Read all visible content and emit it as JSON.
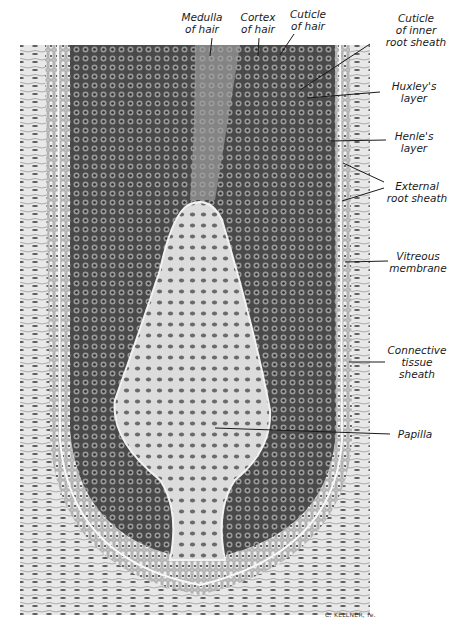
{
  "figure": {
    "signature": "C. KELLNER, fe.",
    "labels_top": [
      {
        "id": "medulla",
        "text": "Medulla\nof hair"
      },
      {
        "id": "cortex",
        "text": "Cortex\nof hair"
      },
      {
        "id": "cuticle-hair",
        "text": "Cuticle\nof hair"
      }
    ],
    "labels_right": [
      {
        "id": "cuticle-inner",
        "text": "Cuticle\nof inner\nroot sheath"
      },
      {
        "id": "huxley",
        "text": "Huxley's\nlayer"
      },
      {
        "id": "henle",
        "text": "Henle's\nlayer"
      },
      {
        "id": "external-root",
        "text": "External\nroot sheath"
      },
      {
        "id": "vitreous",
        "text": "Vitreous\nmembrane"
      },
      {
        "id": "connective",
        "text": "Connective\ntissue\nsheath"
      },
      {
        "id": "papilla",
        "text": "Papilla"
      }
    ],
    "colors": {
      "background": "#ffffff",
      "tissue_dark": "#3c3c3c",
      "tissue_mid": "#8a8a8a",
      "tissue_light": "#d9d9d9",
      "ink": "#1a1a1a"
    }
  }
}
